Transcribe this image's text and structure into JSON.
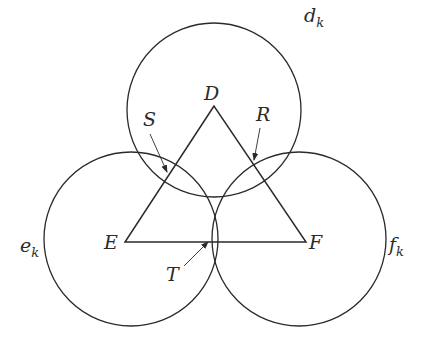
{
  "diagram": {
    "stroke_color": "#2a2a2a",
    "circles": [
      {
        "id": "d",
        "label": "d",
        "subscript": "k",
        "cx": 214,
        "cy": 110,
        "r": 87,
        "label_x": 304,
        "label_y": 22
      },
      {
        "id": "e",
        "label": "e",
        "subscript": "k",
        "cx": 131,
        "cy": 239,
        "r": 87,
        "label_x": 20,
        "label_y": 252
      },
      {
        "id": "f",
        "label": "f",
        "subscript": "k",
        "cx": 299,
        "cy": 239,
        "r": 87,
        "label_x": 389,
        "label_y": 251
      }
    ],
    "triangle": {
      "vertices": [
        {
          "name": "D",
          "x": 214,
          "y": 106,
          "label_x": 204,
          "label_y": 100
        },
        {
          "name": "E",
          "x": 125,
          "y": 242,
          "label_x": 104,
          "label_y": 249
        },
        {
          "name": "F",
          "x": 306,
          "y": 242,
          "label_x": 309,
          "label_y": 249
        }
      ]
    },
    "points": [
      {
        "name": "S",
        "label_x": 143,
        "label_y": 126,
        "arrow_from": [
          150,
          134
        ],
        "arrow_to": [
          167,
          172
        ]
      },
      {
        "name": "R",
        "label_x": 256,
        "label_y": 121,
        "arrow_from": [
          260,
          128
        ],
        "arrow_to": [
          254,
          160
        ]
      },
      {
        "name": "T",
        "label_x": 166,
        "label_y": 281,
        "arrow_from": [
          184,
          266
        ],
        "arrow_to": [
          208,
          242
        ]
      }
    ]
  }
}
